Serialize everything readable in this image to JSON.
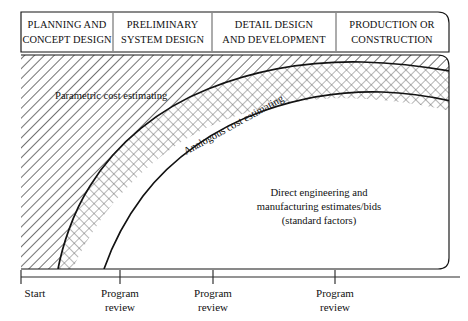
{
  "figure": {
    "type": "diagram"
  },
  "phases": [
    {
      "id": "planning-concept-design",
      "line1": "PLANNING AND",
      "line2": "CONCEPT DESIGN"
    },
    {
      "id": "preliminary-system-design",
      "line1": "PRELIMINARY",
      "line2": "SYSTEM DESIGN"
    },
    {
      "id": "detail-design-development",
      "line1": "DETAIL DESIGN",
      "line2": "AND DEVELOPMENT"
    },
    {
      "id": "production-construction",
      "line1": "PRODUCTION OR",
      "line2": "CONSTRUCTION"
    }
  ],
  "regions": [
    {
      "id": "parametric",
      "label": "Parametric cost estimating",
      "pattern": "diagonal-hatch"
    },
    {
      "id": "analogous",
      "label": "Analogous cost estimating",
      "pattern": "cross-hatch"
    },
    {
      "id": "direct-engineering",
      "line1": "Direct engineering and",
      "line2": "manufacturing estimates/bids",
      "line3": "(standard factors)",
      "pattern": "plain"
    }
  ],
  "axis": {
    "ticks": [
      {
        "id": "start",
        "line1": "Start",
        "line2": ""
      },
      {
        "id": "program-review-1",
        "line1": "Program",
        "line2": "review"
      },
      {
        "id": "program-review-2",
        "line1": "Program",
        "line2": "review"
      },
      {
        "id": "program-review-3",
        "line1": "Program",
        "line2": "review"
      }
    ]
  },
  "colors": {
    "line": "#131313",
    "text": "#111111",
    "hatch": "#4a4a4a",
    "background": "#ffffff"
  }
}
